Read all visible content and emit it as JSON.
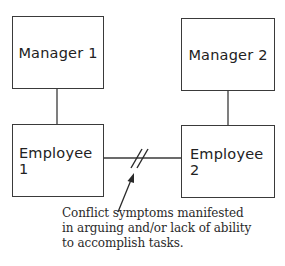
{
  "diagram": {
    "nodes": [
      {
        "id": "manager1",
        "label": "Manager 1"
      },
      {
        "id": "manager2",
        "label": "Manager 2"
      },
      {
        "id": "employee1",
        "label": "Employee 1"
      },
      {
        "id": "employee2",
        "label": "Employee 2"
      }
    ],
    "edges": [
      {
        "from": "manager1",
        "to": "employee1",
        "type": "solid"
      },
      {
        "from": "manager2",
        "to": "employee2",
        "type": "solid"
      },
      {
        "from": "employee1",
        "to": "employee2",
        "type": "broken",
        "marker": "double-slash"
      }
    ],
    "annotation": {
      "lines": [
        "Conflict symptoms manifested",
        "in arguing and/or lack of ability",
        "to accomplish tasks."
      ],
      "points_to": "broken-link-employee1-employee2"
    },
    "colors": {
      "stroke": "#3a3a3a",
      "text": "#222222",
      "background": "#ffffff"
    }
  }
}
